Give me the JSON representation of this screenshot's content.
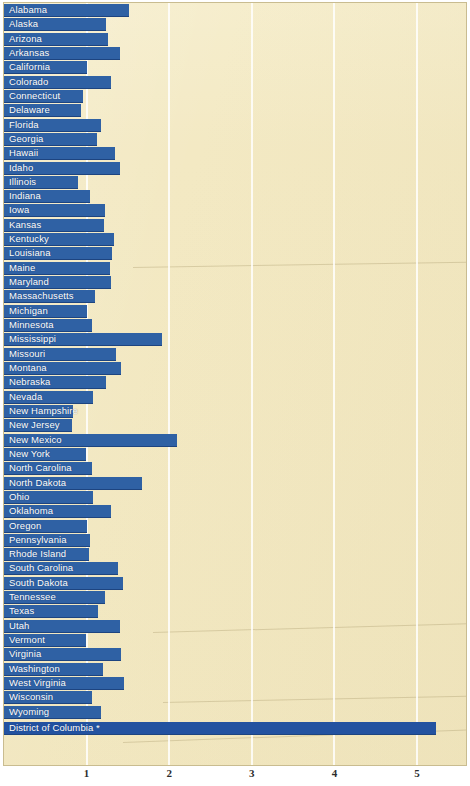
{
  "chart_data": {
    "type": "bar",
    "orientation": "horizontal",
    "title": "",
    "xlabel": "",
    "ylabel": "",
    "xlim": [
      0,
      5.2
    ],
    "xticks": [
      1,
      2,
      3,
      4,
      5
    ],
    "xtick_labels": [
      "1",
      "2",
      "3",
      "4",
      "5"
    ],
    "grid": true,
    "legend": "none",
    "bar_color": "#2f61a4",
    "background_color": "#f3e9c3",
    "gridline_color": "#ffffff",
    "label_color": "#ffffff",
    "categories": [
      "Alabama",
      "Alaska",
      "Arizona",
      "Arkansas",
      "California",
      "Colorado",
      "Connecticut",
      "Delaware",
      "Florida",
      "Georgia",
      "Hawaii",
      "Idaho",
      "Illinois",
      "Indiana",
      "Iowa",
      "Kansas",
      "Kentucky",
      "Louisiana",
      "Maine",
      "Maryland",
      "Massachusetts",
      "Michigan",
      "Minnesota",
      "Mississippi",
      "Missouri",
      "Montana",
      "Nebraska",
      "Nevada",
      "New Hampshire",
      "New Jersey",
      "New Mexico",
      "New York",
      "North Carolina",
      "North Dakota",
      "Ohio",
      "Oklahoma",
      "Oregon",
      "Pennsylvania",
      "Rhode Island",
      "South Carolina",
      "South Dakota",
      "Tennessee",
      "Texas",
      "Utah",
      "Vermont",
      "Virginia",
      "Washington",
      "West Virginia",
      "Wisconsin",
      "Wyoming",
      "District of Columbia *"
    ],
    "values": [
      1.51,
      1.24,
      1.26,
      1.4,
      1.01,
      1.3,
      0.96,
      0.93,
      1.18,
      1.12,
      1.34,
      1.41,
      0.9,
      1.04,
      1.22,
      1.21,
      1.33,
      1.31,
      1.28,
      1.29,
      1.1,
      1.01,
      1.06,
      1.91,
      1.36,
      1.42,
      1.23,
      1.08,
      0.84,
      0.82,
      2.1,
      0.99,
      1.07,
      1.67,
      1.08,
      1.29,
      1.01,
      1.04,
      1.03,
      1.38,
      1.44,
      1.22,
      1.14,
      1.4,
      0.99,
      1.42,
      1.2,
      1.45,
      1.06,
      1.17,
      5.23
    ]
  },
  "axis": {
    "ticks": [
      "1",
      "2",
      "3",
      "4",
      "5"
    ]
  },
  "footnote": "*"
}
